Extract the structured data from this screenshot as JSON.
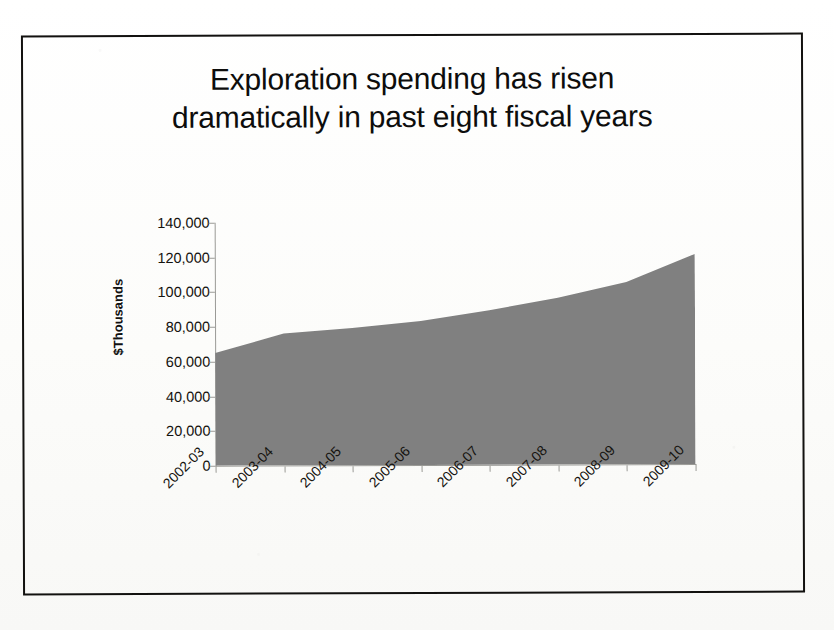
{
  "document": {
    "kind": "scanned-slide",
    "border_color": "#12110f",
    "background_color": "#fdfdfb"
  },
  "chart_data": {
    "type": "area",
    "title": "Exploration spending has risen dramatically in past eight fiscal years",
    "title_lines": [
      "Exploration spending has risen",
      "dramatically in past eight fiscal years"
    ],
    "categories": [
      "2002-03",
      "2003-04",
      "2004-05",
      "2005-06",
      "2006-07",
      "2007-08",
      "2008-09",
      "2009-10"
    ],
    "values": [
      65000,
      76000,
      79000,
      83000,
      89000,
      96000,
      105000,
      121000
    ],
    "xlabel": "",
    "ylabel": "$Thousands",
    "ylim": [
      0,
      140000
    ],
    "ytick_step": 20000,
    "ytick_labels": [
      "140,000",
      "120,000",
      "100,000",
      "80,000",
      "60,000",
      "40,000",
      "20,000",
      "0"
    ],
    "ytick_values": [
      140000,
      120000,
      100000,
      80000,
      60000,
      40000,
      20000,
      0
    ],
    "grid": false,
    "legend": "none",
    "series_color": "#808080",
    "axis_color": "#9a9a96",
    "x_label_rotation_deg": -45
  }
}
